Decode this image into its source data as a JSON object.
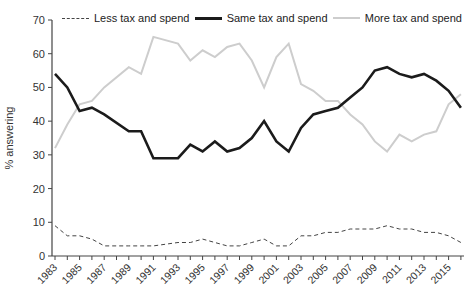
{
  "chart_data": {
    "type": "line",
    "title": "",
    "xlabel": "",
    "ylabel": "% answering",
    "ylim": [
      0,
      70
    ],
    "yticks": [
      0,
      10,
      20,
      30,
      40,
      50,
      60,
      70
    ],
    "xtick_labels": [
      1983,
      1985,
      1987,
      1989,
      1991,
      1993,
      1995,
      1997,
      1999,
      2001,
      2003,
      2005,
      2007,
      2009,
      2011,
      2013,
      2015
    ],
    "x_minor_ticks_start": 1983,
    "x_minor_ticks_end": 2016,
    "grid": false,
    "legend_position": "top",
    "x": [
      1983,
      1984,
      1985,
      1986,
      1987,
      1989,
      1990,
      1991,
      1993,
      1994,
      1995,
      1996,
      1997,
      1998,
      1999,
      2000,
      2001,
      2002,
      2003,
      2004,
      2005,
      2006,
      2007,
      2008,
      2009,
      2010,
      2011,
      2012,
      2013,
      2014,
      2015,
      2016
    ],
    "series": [
      {
        "name": "Less tax and spend",
        "style": "dashed",
        "color": "#444444",
        "width": 1,
        "values": [
          9,
          6,
          6,
          5,
          3,
          3,
          3,
          3,
          4,
          4,
          5,
          4,
          3,
          3,
          4,
          5,
          3,
          3,
          6,
          6,
          7,
          7,
          8,
          8,
          8,
          9,
          8,
          8,
          7,
          7,
          6,
          4
        ]
      },
      {
        "name": "Same tax and spend",
        "style": "solid",
        "color": "#1b1b1b",
        "width": 2.6,
        "values": [
          54,
          50,
          43,
          44,
          42,
          37,
          37,
          29,
          29,
          33,
          31,
          34,
          31,
          32,
          35,
          40,
          34,
          31,
          38,
          42,
          43,
          44,
          47,
          50,
          55,
          56,
          54,
          53,
          54,
          52,
          49,
          44
        ]
      },
      {
        "name": "More tax and spend",
        "style": "solid",
        "color": "#cdcdcd",
        "width": 2,
        "values": [
          32,
          39,
          45,
          46,
          50,
          56,
          54,
          65,
          63,
          58,
          61,
          59,
          62,
          63,
          58,
          50,
          59,
          63,
          51,
          49,
          46,
          46,
          42,
          39,
          34,
          31,
          36,
          34,
          36,
          37,
          45,
          48
        ]
      }
    ],
    "axis_color": "#444444",
    "tick_label_color": "#333333"
  }
}
